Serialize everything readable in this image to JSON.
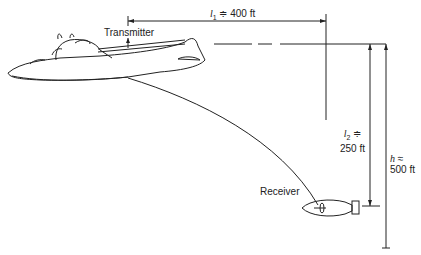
{
  "labels": {
    "transmitter": "Transmitter",
    "receiver": "Receiver",
    "l1": {
      "symbol": "l",
      "sub": "1",
      "rel": "≑",
      "value": "400 ft"
    },
    "l2": {
      "symbol": "l",
      "sub": "2",
      "rel": "≑",
      "value": "250 ft"
    },
    "h": {
      "symbol": "h",
      "rel": "≈",
      "value": "500 ft"
    }
  },
  "colors": {
    "line": "#222222",
    "background": "#ffffff"
  }
}
